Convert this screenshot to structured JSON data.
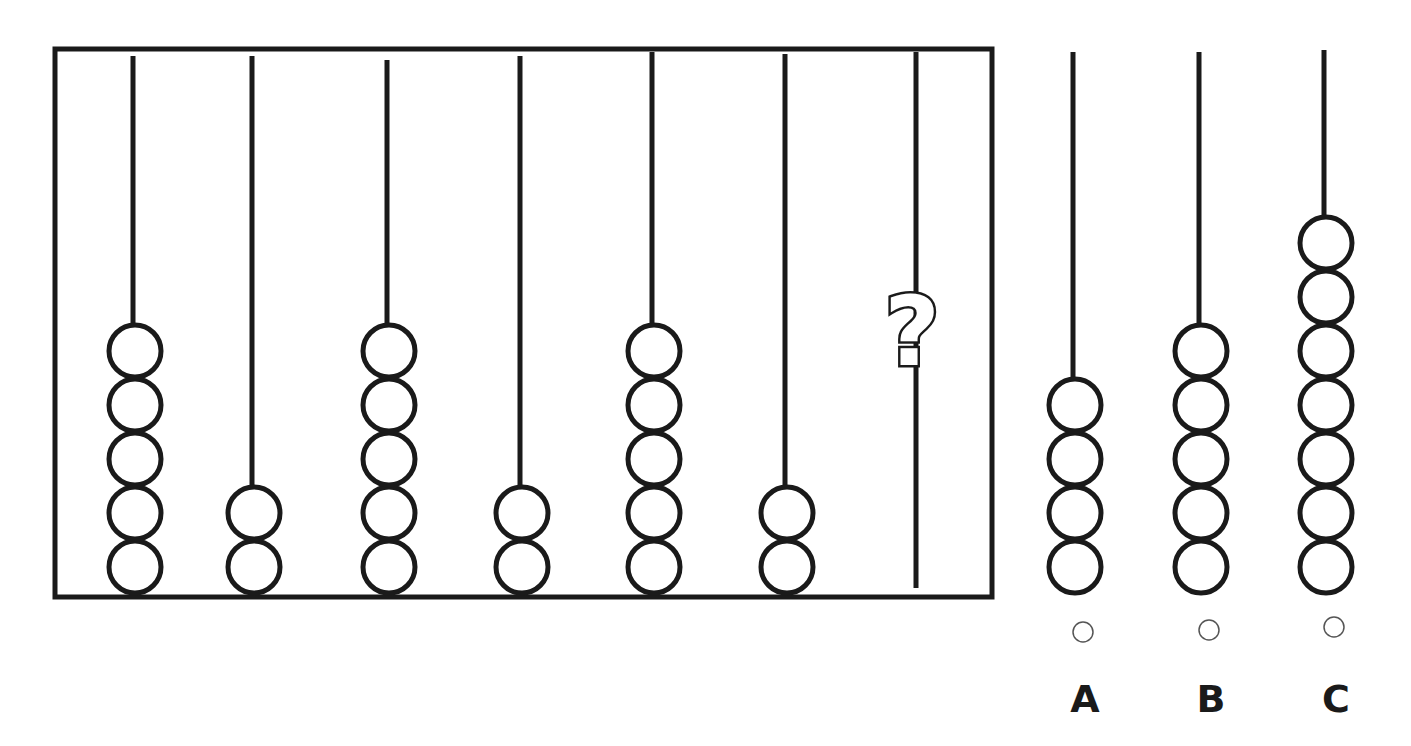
{
  "puzzle": {
    "type": "abacus-sequence",
    "question_mark": "?",
    "frame": {
      "x": 55,
      "y": 49,
      "width": 937,
      "height": 548,
      "stroke": "#1a1a1a"
    },
    "rods": [
      {
        "x": 133,
        "top": 56,
        "beads": 5
      },
      {
        "x": 252,
        "top": 56,
        "beads": 2
      },
      {
        "x": 387,
        "top": 60,
        "beads": 5
      },
      {
        "x": 520,
        "top": 56,
        "beads": 2
      },
      {
        "x": 652,
        "top": 52,
        "beads": 5
      },
      {
        "x": 785,
        "top": 54,
        "beads": 2
      },
      {
        "x": 916,
        "top": 52,
        "beads": null,
        "unknown": true
      }
    ],
    "sequence_values": [
      5,
      2,
      5,
      2,
      5,
      2,
      "?"
    ],
    "bead_radius": 26,
    "bead_spacing": 54,
    "bead_bottom_cy": 567
  },
  "options": [
    {
      "label": "A",
      "x": 1073,
      "top": 52,
      "beads": 4,
      "radio_y": 632,
      "selected": false
    },
    {
      "label": "B",
      "x": 1199,
      "top": 52,
      "beads": 5,
      "radio_y": 630,
      "selected": false
    },
    {
      "label": "C",
      "x": 1324,
      "top": 50,
      "beads": 7,
      "radio_y": 627,
      "selected": false
    }
  ],
  "colors": {
    "ink": "#1a1a1a",
    "radio": "#555555",
    "background": "#ffffff"
  }
}
